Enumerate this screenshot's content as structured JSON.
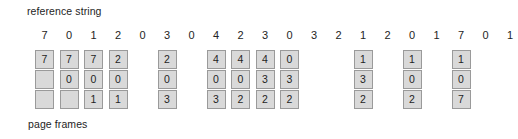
{
  "figure": {
    "type": "fifo-page-replacement-diagram",
    "reference_string_label": "reference string",
    "page_frames_label": "page frames",
    "colors": {
      "cell_fill": "#d9d9d9",
      "cell_border": "#9a9a9a",
      "text": "#1f1f1f",
      "background": "#ffffff"
    }
  },
  "chart_data": {
    "type": "table",
    "title": "reference string",
    "xlabel": "",
    "ylabel": "page frames",
    "frame_count": 3,
    "reference_string": [
      7,
      0,
      1,
      2,
      0,
      3,
      0,
      4,
      2,
      3,
      0,
      3,
      2,
      1,
      2,
      0,
      1,
      7,
      0,
      1
    ],
    "columns": [
      {
        "index": 0,
        "reference": "7",
        "has_frames": true,
        "frames": [
          "7",
          "",
          ""
        ]
      },
      {
        "index": 1,
        "reference": "0",
        "has_frames": true,
        "frames": [
          "7",
          "0",
          ""
        ]
      },
      {
        "index": 2,
        "reference": "1",
        "has_frames": true,
        "frames": [
          "7",
          "0",
          "1"
        ]
      },
      {
        "index": 3,
        "reference": "2",
        "has_frames": true,
        "frames": [
          "2",
          "0",
          "1"
        ]
      },
      {
        "index": 4,
        "reference": "0",
        "has_frames": false,
        "frames": []
      },
      {
        "index": 5,
        "reference": "3",
        "has_frames": true,
        "frames": [
          "2",
          "0",
          "3"
        ]
      },
      {
        "index": 6,
        "reference": "0",
        "has_frames": false,
        "frames": []
      },
      {
        "index": 7,
        "reference": "4",
        "has_frames": true,
        "frames": [
          "4",
          "0",
          "3"
        ]
      },
      {
        "index": 8,
        "reference": "2",
        "has_frames": true,
        "frames": [
          "4",
          "0",
          "2"
        ]
      },
      {
        "index": 9,
        "reference": "3",
        "has_frames": true,
        "frames": [
          "4",
          "3",
          "2"
        ]
      },
      {
        "index": 10,
        "reference": "0",
        "has_frames": true,
        "frames": [
          "0",
          "3",
          "2"
        ]
      },
      {
        "index": 11,
        "reference": "3",
        "has_frames": false,
        "frames": []
      },
      {
        "index": 12,
        "reference": "2",
        "has_frames": false,
        "frames": []
      },
      {
        "index": 13,
        "reference": "1",
        "has_frames": true,
        "frames": [
          "1",
          "3",
          "2"
        ]
      },
      {
        "index": 14,
        "reference": "2",
        "has_frames": false,
        "frames": []
      },
      {
        "index": 15,
        "reference": "0",
        "has_frames": true,
        "frames": [
          "1",
          "0",
          "2"
        ]
      },
      {
        "index": 16,
        "reference": "1",
        "has_frames": false,
        "frames": []
      },
      {
        "index": 17,
        "reference": "7",
        "has_frames": true,
        "frames": [
          "1",
          "0",
          "7"
        ]
      },
      {
        "index": 18,
        "reference": "0",
        "has_frames": false,
        "frames": []
      },
      {
        "index": 19,
        "reference": "1",
        "has_frames": false,
        "frames": []
      }
    ]
  }
}
